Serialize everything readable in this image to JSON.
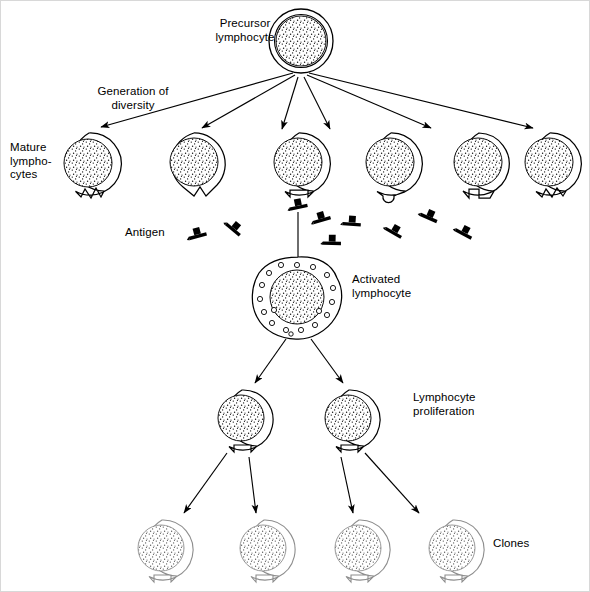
{
  "figure": {
    "title_semantic": "clonal-selection-of-lymphocytes",
    "background_color": "#ffffff",
    "stroke_color": "#000000",
    "faded_stroke_color": "#9a9a9a",
    "antigen_color": "#000000"
  },
  "labels": {
    "precursor": "Precursor\nlymphocyte",
    "generation_of_diversity": "Generation of\ndiversity",
    "mature_lymphocytes": "Mature\nlympho-\ncytes",
    "antigen": "Antigen",
    "activated": "Activated\nlymphocyte",
    "proliferation": "Lymphocyte\nproliferation",
    "clones": "Clones"
  },
  "stages": {
    "precursor": {
      "name": "precursor-lymphocyte",
      "cx": 300,
      "cy": 40,
      "r_outer": 32,
      "r_inner": 25,
      "stippled": true
    },
    "mature_row": {
      "name": "mature-lymphocyte-row",
      "count": 6,
      "cy": 163,
      "r_outer": 31,
      "r_inner": 24,
      "cells": [
        {
          "cx": 88,
          "receptor": "zigzag-right",
          "selected": false
        },
        {
          "cx": 193,
          "receptor": "v-notch",
          "selected": false
        },
        {
          "cx": 298,
          "receptor": "square-notch",
          "selected": true
        },
        {
          "cx": 390,
          "receptor": "round-notch",
          "selected": false
        },
        {
          "cx": 478,
          "receptor": "step-notch",
          "selected": false
        },
        {
          "cx": 549,
          "receptor": "zigzag-small",
          "selected": false
        }
      ]
    },
    "activated": {
      "name": "activated-lymphocyte",
      "cx": 297,
      "cy": 297,
      "r_outer": 41,
      "r_inner": 27,
      "vacuole_count": 18
    },
    "proliferation_row": {
      "name": "proliferating-lymphocyte-row",
      "count": 2,
      "cy": 419,
      "r_outer": 30,
      "r_inner": 23,
      "cells": [
        {
          "cx": 241,
          "receptor": "square-notch"
        },
        {
          "cx": 348,
          "receptor": "square-notch"
        }
      ]
    },
    "clone_row": {
      "name": "clone-lymphocyte-row",
      "count": 4,
      "cy": 549,
      "r_outer": 30,
      "r_inner": 23,
      "faded": true,
      "cells": [
        {
          "cx": 161,
          "receptor": "square-notch"
        },
        {
          "cx": 263,
          "receptor": "square-notch"
        },
        {
          "cx": 358,
          "receptor": "square-notch"
        },
        {
          "cx": 452,
          "receptor": "square-notch"
        }
      ]
    }
  },
  "antigens": {
    "name": "antigen-particles",
    "count": 9,
    "bound_to_cell_index": 2,
    "particles": [
      {
        "x": 196,
        "y": 232,
        "rot": -18,
        "bound": false
      },
      {
        "x": 232,
        "y": 227,
        "rot": 38,
        "bound": false
      },
      {
        "x": 297,
        "y": 203,
        "rot": -12,
        "bound": true
      },
      {
        "x": 319,
        "y": 214,
        "rot": -18,
        "bound": false
      },
      {
        "x": 348,
        "y": 219,
        "rot": 5,
        "bound": false
      },
      {
        "x": 330,
        "y": 238,
        "rot": 2,
        "bound": false
      },
      {
        "x": 392,
        "y": 228,
        "rot": 30,
        "bound": false
      },
      {
        "x": 428,
        "y": 215,
        "rot": 22,
        "bound": false
      },
      {
        "x": 463,
        "y": 229,
        "rot": 28,
        "bound": false
      }
    ]
  },
  "arrows": {
    "generation_of_diversity": {
      "name": "diversity-arrows",
      "count": 6,
      "from": {
        "x": 300,
        "y": 72
      },
      "to": [
        {
          "x": 100,
          "y": 126
        },
        {
          "x": 201,
          "y": 127
        },
        {
          "x": 281,
          "y": 128
        },
        {
          "x": 329,
          "y": 128
        },
        {
          "x": 430,
          "y": 127
        },
        {
          "x": 532,
          "y": 127
        }
      ]
    },
    "antigen_selection": {
      "name": "antigen-selection-line",
      "from": {
        "x": 297,
        "y": 212
      },
      "to": {
        "x": 297,
        "y": 258
      }
    },
    "proliferation": {
      "name": "proliferation-arrows",
      "count": 2,
      "from": {
        "x": 297,
        "y": 340
      },
      "to": [
        {
          "x": 254,
          "y": 382
        },
        {
          "x": 342,
          "y": 382
        }
      ]
    },
    "cloning": {
      "name": "cloning-arrows",
      "count": 4,
      "pairs": [
        {
          "from": {
            "x": 230,
            "y": 452
          },
          "to": {
            "x": 183,
            "y": 512
          }
        },
        {
          "from": {
            "x": 251,
            "y": 452
          },
          "to": {
            "x": 253,
            "y": 512
          }
        },
        {
          "from": {
            "x": 340,
            "y": 452
          },
          "to": {
            "x": 352,
            "y": 512
          }
        },
        {
          "from": {
            "x": 361,
            "y": 452
          },
          "to": {
            "x": 417,
            "y": 512
          }
        }
      ]
    }
  },
  "label_positions": {
    "precursor": {
      "x": 198,
      "y": 18,
      "align": "center",
      "w": 92
    },
    "generation": {
      "x": 80,
      "y": 83,
      "align": "center",
      "w": 104
    },
    "mature": {
      "x": 8,
      "y": 140,
      "align": "left",
      "w": 56
    },
    "antigen": {
      "x": 124,
      "y": 225,
      "align": "left",
      "w": 56
    },
    "activated": {
      "x": 350,
      "y": 272,
      "align": "left",
      "w": 92
    },
    "proliferation": {
      "x": 412,
      "y": 391,
      "align": "left",
      "w": 96
    },
    "clones": {
      "x": 492,
      "y": 536,
      "align": "left",
      "w": 56
    }
  }
}
